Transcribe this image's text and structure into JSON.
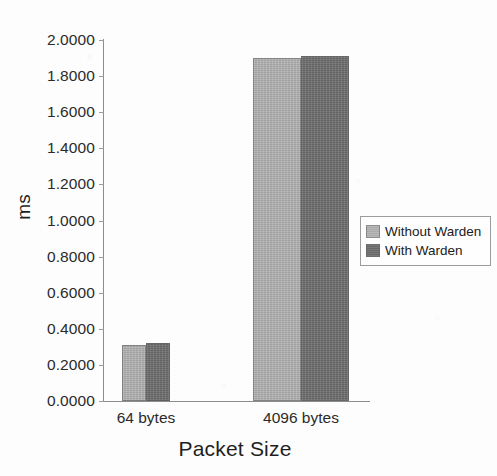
{
  "chart_data": {
    "type": "bar",
    "title": "",
    "subtitle": "",
    "xlabel": "Packet Size",
    "ylabel": "ms",
    "categories": [
      "64 bytes",
      "4096 bytes"
    ],
    "series": [
      {
        "name": "Without Warden",
        "color": "#b2b2b2",
        "values": [
          0.31,
          1.9
        ]
      },
      {
        "name": "With Warden",
        "color": "#6f6f6f",
        "values": [
          0.32,
          1.91
        ]
      }
    ],
    "ylim": [
      0.0,
      2.0
    ],
    "ytick_step": 0.2,
    "ytick_labels": [
      "2.0000",
      "1.8000",
      "1.6000",
      "1.4000",
      "1.2000",
      "1.0000",
      "0.8000",
      "0.6000",
      "0.4000",
      "0.2000",
      "0.0000"
    ],
    "ytick_values": [
      2.0,
      1.8,
      1.6,
      1.4,
      1.2,
      1.0,
      0.8,
      0.6,
      0.4,
      0.2,
      0.0
    ],
    "grid": false,
    "legend_position": "right-center",
    "legend_entries": [
      "Without Warden",
      "With Warden"
    ],
    "axis_color": "#8d8d8d",
    "background_color": "#fdfdfd"
  }
}
